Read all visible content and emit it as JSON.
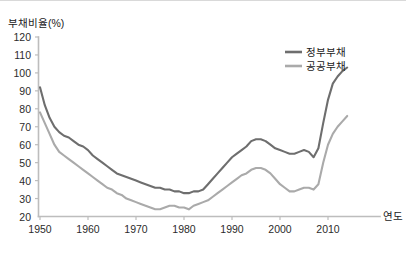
{
  "chart_data": {
    "type": "line",
    "title": "",
    "ylabel": "부채비율(%)",
    "xlabel": "연도",
    "ylim": [
      20,
      120
    ],
    "xlim": [
      1949,
      2015
    ],
    "yticks": [
      20,
      30,
      40,
      50,
      60,
      70,
      80,
      90,
      100,
      110,
      120
    ],
    "xticks": [
      1950,
      1960,
      1970,
      1980,
      1990,
      2000,
      2010
    ],
    "grid": false,
    "legend_position": "top-right",
    "colors": {
      "government_debt": "#6e6e6e",
      "public_debt": "#aaaaaa",
      "axis": "#bdbdbd",
      "text": "#1a1a1a",
      "background": "#ffffff"
    },
    "x": [
      1950,
      1951,
      1952,
      1953,
      1954,
      1955,
      1956,
      1957,
      1958,
      1959,
      1960,
      1961,
      1962,
      1963,
      1964,
      1965,
      1966,
      1967,
      1968,
      1969,
      1970,
      1971,
      1972,
      1973,
      1974,
      1975,
      1976,
      1977,
      1978,
      1979,
      1980,
      1981,
      1982,
      1983,
      1984,
      1985,
      1986,
      1987,
      1988,
      1989,
      1990,
      1991,
      1992,
      1993,
      1994,
      1995,
      1996,
      1997,
      1998,
      1999,
      2000,
      2001,
      2002,
      2003,
      2004,
      2005,
      2006,
      2007,
      2008,
      2009,
      2010,
      2011,
      2012,
      2013,
      2014
    ],
    "series": [
      {
        "name": "정부부채",
        "color": "#6e6e6e",
        "values": [
          92,
          82,
          75,
          70,
          67,
          65,
          64,
          62,
          60,
          59,
          57,
          54,
          52,
          50,
          48,
          46,
          44,
          43,
          42,
          41,
          40,
          39,
          38,
          37,
          36,
          36,
          35,
          35,
          34,
          34,
          33,
          33,
          34,
          34,
          35,
          38,
          41,
          44,
          47,
          50,
          53,
          55,
          57,
          59,
          62,
          63,
          63,
          62,
          60,
          58,
          57,
          56,
          55,
          55,
          56,
          57,
          56,
          53,
          58,
          72,
          85,
          94,
          98,
          101,
          103
        ],
        "min": 33,
        "max": 103,
        "start_value": 92,
        "end_value": 103
      },
      {
        "name": "공공부채",
        "color": "#aaaaaa",
        "values": [
          78,
          72,
          66,
          60,
          56,
          54,
          52,
          50,
          48,
          46,
          44,
          42,
          40,
          38,
          36,
          35,
          33,
          32,
          30,
          29,
          28,
          27,
          26,
          25,
          24,
          24,
          25,
          26,
          26,
          25,
          25,
          24,
          26,
          27,
          28,
          29,
          31,
          33,
          35,
          37,
          39,
          41,
          43,
          44,
          46,
          47,
          47,
          46,
          44,
          41,
          38,
          36,
          34,
          34,
          35,
          36,
          36,
          35,
          38,
          50,
          60,
          66,
          70,
          73,
          76
        ],
        "min": 24,
        "max": 76,
        "start_value": 78,
        "end_value": 76
      }
    ]
  },
  "legend": {
    "items": [
      {
        "label": "정부부채",
        "color": "#6e6e6e"
      },
      {
        "label": "공공부채",
        "color": "#aaaaaa"
      }
    ]
  },
  "axes": {
    "y_title": "부채비율(%)",
    "x_title": "연도",
    "y_tick_labels": [
      "120",
      "110",
      "100",
      "90",
      "80",
      "70",
      "60",
      "50",
      "40",
      "30",
      "20"
    ],
    "x_tick_labels": [
      "1950",
      "1960",
      "1970",
      "1980",
      "1990",
      "2000",
      "2010"
    ]
  }
}
